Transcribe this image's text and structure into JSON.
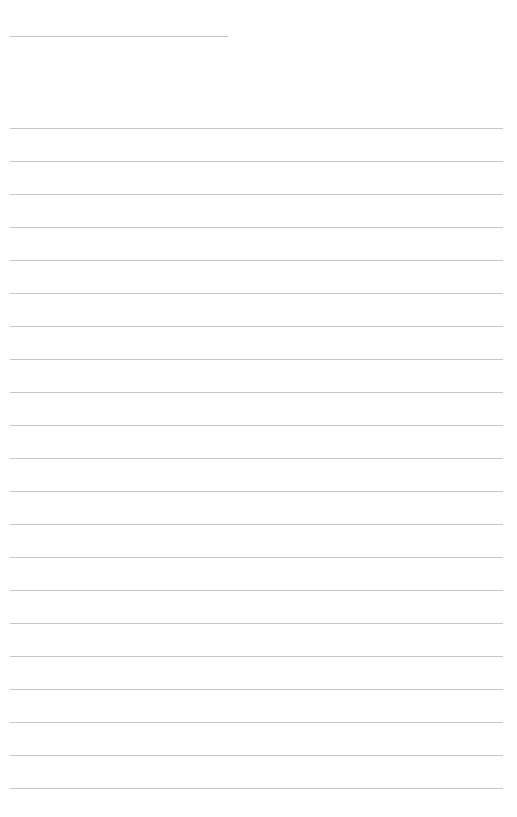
{
  "page": {
    "type": "blank lined sheet",
    "background_color": "#ffffff",
    "line_color": "#c6c6c6",
    "title_line": {
      "text": ""
    },
    "ruled_lines": {
      "count": 21,
      "entries": [
        "",
        "",
        "",
        "",
        "",
        "",
        "",
        "",
        "",
        "",
        "",
        "",
        "",
        "",
        "",
        "",
        "",
        "",
        "",
        "",
        ""
      ]
    }
  }
}
